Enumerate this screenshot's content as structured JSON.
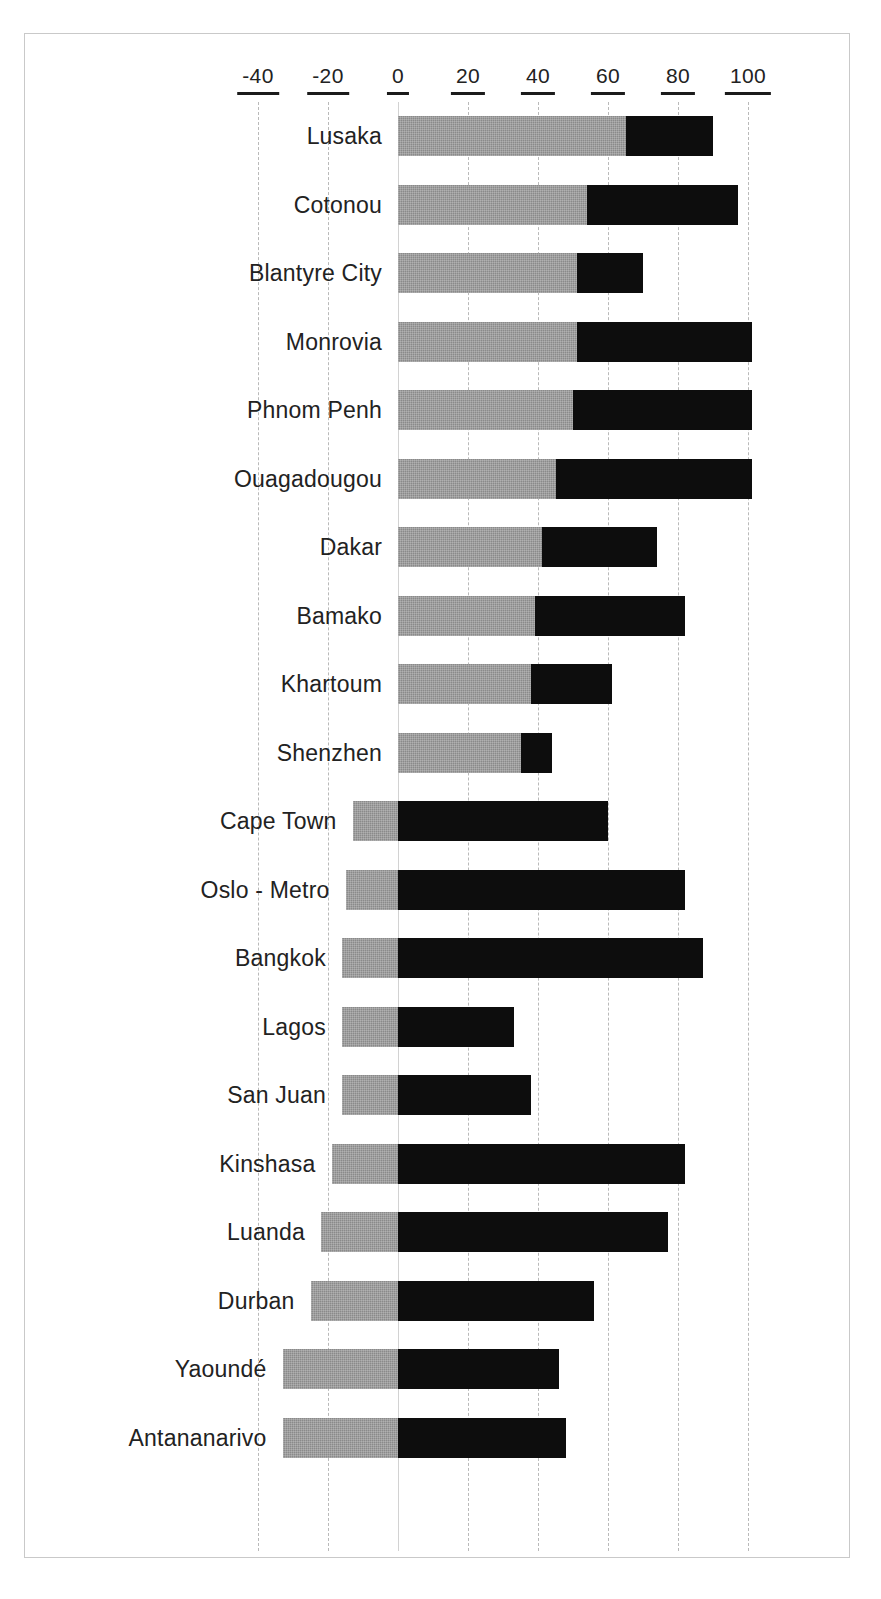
{
  "chart_data": {
    "type": "bar",
    "orientation": "horizontal",
    "stacked": true,
    "title": "",
    "subtitle": "",
    "xlabel": "",
    "ylabel": "",
    "xlim": [
      -50,
      110
    ],
    "axis_ticks": [
      "-40",
      "-20",
      "0",
      "20",
      "40",
      "60",
      "80",
      "100"
    ],
    "axis_tick_values": [
      -40,
      -20,
      0,
      20,
      40,
      60,
      80,
      100
    ],
    "grid": true,
    "legend": "none",
    "colors": {
      "gray_segment": "#8a8a8a",
      "black_segment": "#0d0d0d",
      "gridline": "#b9b9b9",
      "frame": "#c9c9c9",
      "text": "#222222"
    },
    "categories": [
      "Lusaka",
      "Cotonou",
      "Blantyre City",
      "Monrovia",
      "Phnom Penh",
      "Ouagadougou",
      "Dakar",
      "Bamako",
      "Khartoum",
      "Shenzhen",
      "Cape Town",
      "Oslo  - Metro",
      "Bangkok",
      "Lagos",
      "San Juan",
      "Kinshasa",
      "Luanda",
      "Durban",
      "Yaoundé",
      "Antananarivo"
    ],
    "series": [
      {
        "name": "gray",
        "segment_start": [
          0,
          0,
          0,
          0,
          0,
          0,
          0,
          0,
          0,
          0,
          -13,
          -15,
          -16,
          -16,
          -16,
          -19,
          -22,
          -25,
          -33,
          -33
        ],
        "segment_end": [
          65,
          54,
          51,
          51,
          50,
          45,
          41,
          39,
          38,
          35,
          0,
          0,
          0,
          0,
          0,
          0,
          0,
          0,
          0,
          0
        ]
      },
      {
        "name": "black",
        "segment_start": [
          65,
          54,
          51,
          51,
          50,
          45,
          41,
          39,
          38,
          35,
          0,
          0,
          0,
          0,
          0,
          0,
          0,
          0,
          0,
          0
        ],
        "segment_end": [
          90,
          97,
          70,
          101,
          101,
          101,
          74,
          82,
          61,
          44,
          60,
          82,
          87,
          33,
          38,
          82,
          77,
          56,
          46,
          48
        ]
      }
    ],
    "rows": [
      {
        "label": "Lusaka",
        "gray_start": 0,
        "gray_end": 65,
        "black_start": 65,
        "black_end": 90
      },
      {
        "label": "Cotonou",
        "gray_start": 0,
        "gray_end": 54,
        "black_start": 54,
        "black_end": 97
      },
      {
        "label": "Blantyre City",
        "gray_start": 0,
        "gray_end": 51,
        "black_start": 51,
        "black_end": 70
      },
      {
        "label": "Monrovia",
        "gray_start": 0,
        "gray_end": 51,
        "black_start": 51,
        "black_end": 101
      },
      {
        "label": "Phnom Penh",
        "gray_start": 0,
        "gray_end": 50,
        "black_start": 50,
        "black_end": 101
      },
      {
        "label": "Ouagadougou",
        "gray_start": 0,
        "gray_end": 45,
        "black_start": 45,
        "black_end": 101
      },
      {
        "label": "Dakar",
        "gray_start": 0,
        "gray_end": 41,
        "black_start": 41,
        "black_end": 74
      },
      {
        "label": "Bamako",
        "gray_start": 0,
        "gray_end": 39,
        "black_start": 39,
        "black_end": 82
      },
      {
        "label": "Khartoum",
        "gray_start": 0,
        "gray_end": 38,
        "black_start": 38,
        "black_end": 61
      },
      {
        "label": "Shenzhen",
        "gray_start": 0,
        "gray_end": 35,
        "black_start": 35,
        "black_end": 44
      },
      {
        "label": "Cape Town",
        "gray_start": -13,
        "gray_end": 0,
        "black_start": 0,
        "black_end": 60
      },
      {
        "label": "Oslo  - Metro",
        "gray_start": -15,
        "gray_end": 0,
        "black_start": 0,
        "black_end": 82
      },
      {
        "label": "Bangkok",
        "gray_start": -16,
        "gray_end": 0,
        "black_start": 0,
        "black_end": 87
      },
      {
        "label": "Lagos",
        "gray_start": -16,
        "gray_end": 0,
        "black_start": 0,
        "black_end": 33
      },
      {
        "label": "San Juan",
        "gray_start": -16,
        "gray_end": 0,
        "black_start": 0,
        "black_end": 38
      },
      {
        "label": "Kinshasa",
        "gray_start": -19,
        "gray_end": 0,
        "black_start": 0,
        "black_end": 82
      },
      {
        "label": "Luanda",
        "gray_start": -22,
        "gray_end": 0,
        "black_start": 0,
        "black_end": 77
      },
      {
        "label": "Durban",
        "gray_start": -25,
        "gray_end": 0,
        "black_start": 0,
        "black_end": 56
      },
      {
        "label": "Yaoundé",
        "gray_start": -33,
        "gray_end": 0,
        "black_start": 0,
        "black_end": 46
      },
      {
        "label": "Antananarivo",
        "gray_start": -33,
        "gray_end": 0,
        "black_start": 0,
        "black_end": 48
      }
    ]
  }
}
